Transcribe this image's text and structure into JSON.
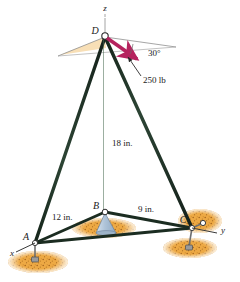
{
  "figure": {
    "background_color": "#ffffff",
    "colors": {
      "strut": "#1f3326",
      "strut_highlight": "#3d5c45",
      "force_arrow": "#b5235e",
      "axis_line": "#8a8a8a",
      "ground_patch": "#e89a2c",
      "ground_patch_light": "#f4c87a",
      "anchor_bolt": "#8c8c8c",
      "shaded_wedge": "#f5d9a8",
      "cone_base": "#b9cbdd",
      "label_text": "#1a1a1a"
    },
    "axes": [
      {
        "name": "z",
        "label": "z",
        "x": 105,
        "y": 11
      },
      {
        "name": "y",
        "label": "y",
        "x": 223,
        "y": 233
      },
      {
        "name": "x",
        "label": "x",
        "x": 12,
        "y": 256
      }
    ],
    "nodes": [
      {
        "name": "D",
        "label": "D",
        "px": 105,
        "py": 36,
        "label_x": 95,
        "label_y": 34
      },
      {
        "name": "A",
        "label": "A",
        "px": 35,
        "py": 243,
        "label_x": 26,
        "label_y": 240
      },
      {
        "name": "B",
        "label": "B",
        "px": 105,
        "py": 212,
        "label_x": 96,
        "label_y": 209
      },
      {
        "name": "C",
        "label": "C",
        "px": 192,
        "py": 228,
        "label_x": 183,
        "label_y": 223
      }
    ],
    "dimensions": [
      {
        "name": "mast-height",
        "label": "18 in.",
        "x": 112,
        "y": 146
      },
      {
        "name": "span-a-to-b",
        "label": "12 in.",
        "x": 52,
        "y": 220
      },
      {
        "name": "span-b-to-c",
        "label": "9 in.",
        "x": 138,
        "y": 212
      }
    ],
    "force": {
      "magnitude_label": "250 lb",
      "magnitude_x": 143,
      "magnitude_y": 83,
      "angle_label": "30°",
      "angle_x": 148,
      "angle_y": 56,
      "arrow_from_x": 107,
      "arrow_from_y": 38,
      "arrow_to_x": 139,
      "arrow_to_y": 60
    },
    "members": [
      {
        "name": "mast-D-B",
        "from": "D",
        "to": "B"
      },
      {
        "name": "leg-D-A",
        "from": "D",
        "to": "A"
      },
      {
        "name": "leg-D-C",
        "from": "D",
        "to": "C"
      },
      {
        "name": "base-A-B",
        "from": "A",
        "to": "B"
      },
      {
        "name": "base-B-C",
        "from": "B",
        "to": "C"
      },
      {
        "name": "base-A-C",
        "from": "A",
        "to": "C"
      }
    ]
  }
}
